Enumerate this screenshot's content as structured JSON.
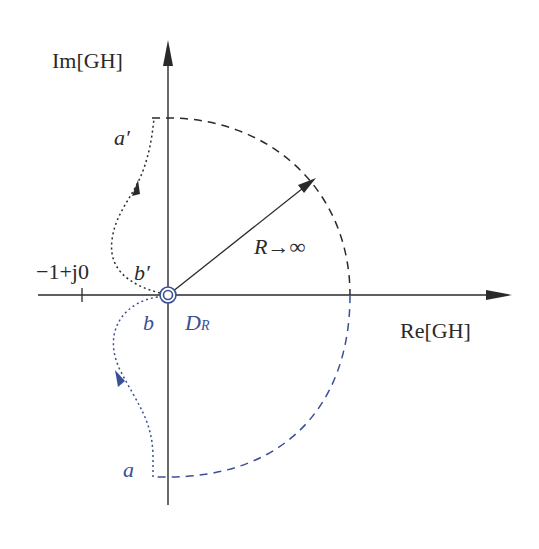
{
  "diagram": {
    "axes": {
      "y_label": "Im[GH]",
      "x_label": "Re[GH]"
    },
    "labels": {
      "minus_one_point": "−1+j0",
      "a_prime": "a′",
      "b_prime": "b′",
      "a": "a",
      "b": "b",
      "radius": "R→∞",
      "d_r": "D",
      "d_r_sub": "R"
    },
    "colors": {
      "axis": "#2a2a2a",
      "upper_path": "#2a2a2a",
      "lower_path": "#3b4f96"
    }
  }
}
